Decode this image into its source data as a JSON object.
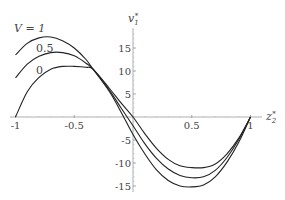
{
  "chart_data": {
    "type": "line",
    "title": "",
    "xlabel": "z2*",
    "ylabel": "v1*",
    "xlim": [
      -1,
      1
    ],
    "ylim": [
      -16,
      19
    ],
    "grid": false,
    "legend": "inline curve labels at upper left",
    "x_ticks": [
      -1,
      -0.5,
      0.5,
      1
    ],
    "x_tick_labels": [
      "-1",
      "-0.5",
      "0.5",
      "1"
    ],
    "y_ticks": [
      15,
      10,
      5,
      -5,
      -10,
      -15
    ],
    "y_tick_labels": [
      "15",
      "10",
      "5",
      "-5",
      "-10",
      "-15"
    ],
    "x": [
      -1,
      -0.9,
      -0.8,
      -0.7,
      -0.6,
      -0.5,
      -0.4,
      -0.34,
      -0.2,
      -0.1,
      0,
      0.1,
      0.2,
      0.3,
      0.4,
      0.5,
      0.6,
      0.7,
      0.8,
      0.9,
      1
    ],
    "series": [
      {
        "name": "V = 1",
        "label": "V = 1",
        "values": [
          13.5,
          16.0,
          17.2,
          17.4,
          16.6,
          15.0,
          12.5,
          10.4,
          5.5,
          1.0,
          -3.8,
          -8.0,
          -11.5,
          -13.8,
          -15.0,
          -15.2,
          -14.8,
          -13.0,
          -9.8,
          -5.5,
          0
        ]
      },
      {
        "name": "V = 0.5",
        "label": "0.5",
        "values": [
          8.5,
          11.5,
          13.2,
          14.0,
          14.0,
          13.3,
          11.7,
          10.4,
          5.8,
          1.9,
          -1.9,
          -5.8,
          -9.0,
          -11.3,
          -12.7,
          -13.2,
          -13.0,
          -11.6,
          -8.8,
          -4.9,
          0
        ]
      },
      {
        "name": "V = 0",
        "label": "0",
        "values": [
          0,
          5.5,
          8.6,
          10.4,
          11.0,
          11.0,
          10.8,
          10.4,
          6.2,
          3.0,
          0.0,
          -3.6,
          -6.8,
          -9.2,
          -10.6,
          -11.0,
          -11.0,
          -10.2,
          -8.0,
          -4.6,
          0
        ]
      }
    ],
    "annotations": [
      {
        "text": "V = 1",
        "x": -0.96,
        "y": 19.5
      },
      {
        "text": "0.5",
        "x": -0.8,
        "y": 14.8
      },
      {
        "text": "0",
        "x": -0.8,
        "y": 10.0
      }
    ]
  },
  "labels": {
    "xaxis": "z",
    "xaxis_sub": "2",
    "xaxis_sup": "*",
    "yaxis": "v",
    "yaxis_sub": "1",
    "yaxis_sup": "*",
    "curve_v1": "V = 1",
    "curve_v05": "0.5",
    "curve_v0": "0"
  },
  "colors": {
    "curve": "#222222",
    "axis": "#888888",
    "text": "#444444"
  }
}
